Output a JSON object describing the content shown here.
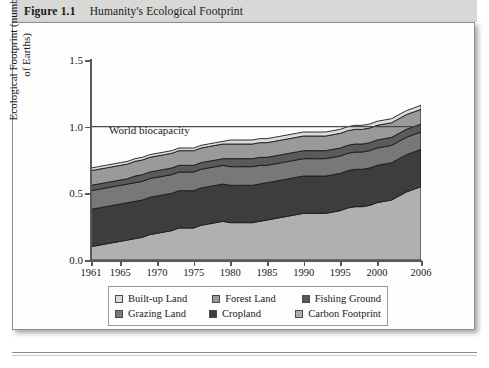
{
  "figure": {
    "number": "Figure 1.1",
    "title": "Humanity's Ecological Footprint"
  },
  "annotation": {
    "biocapacity_label": "World biocapacity"
  },
  "chart_data": {
    "type": "area",
    "title": "Humanity's Ecological Footprint",
    "xlabel": "",
    "ylabel": "Ecological Footprint (number of Earths)",
    "ylabel_line1": "Ecological Footprint (number",
    "ylabel_line2": "of Earths)",
    "xlim": [
      1961,
      2006
    ],
    "ylim": [
      0.0,
      1.5
    ],
    "yticks": [
      "0.0",
      "0.5",
      "1.0",
      "1.5"
    ],
    "ytick_values": [
      0.0,
      0.5,
      1.0,
      1.5
    ],
    "xticks": [
      "1961",
      "1965",
      "1970",
      "1975",
      "1980",
      "1985",
      "1990",
      "1995",
      "2000",
      "2006"
    ],
    "xtick_values": [
      1961,
      1965,
      1970,
      1975,
      1980,
      1985,
      1990,
      1995,
      2000,
      2006
    ],
    "grid": false,
    "stacked": true,
    "legend_position": "below-axes",
    "reference_line": {
      "label": "World biocapacity",
      "y": 1.0
    },
    "x": [
      1961,
      1962,
      1963,
      1964,
      1965,
      1966,
      1967,
      1968,
      1969,
      1970,
      1971,
      1972,
      1973,
      1974,
      1975,
      1976,
      1977,
      1978,
      1979,
      1980,
      1981,
      1982,
      1983,
      1984,
      1985,
      1986,
      1987,
      1988,
      1989,
      1990,
      1991,
      1992,
      1993,
      1994,
      1995,
      1996,
      1997,
      1998,
      1999,
      2000,
      2001,
      2002,
      2003,
      2004,
      2005,
      2006
    ],
    "series": [
      {
        "name": "Carbon Footprint",
        "color": "#b0b0b0",
        "values": [
          0.1,
          0.11,
          0.12,
          0.13,
          0.14,
          0.15,
          0.16,
          0.17,
          0.19,
          0.2,
          0.21,
          0.22,
          0.24,
          0.24,
          0.24,
          0.26,
          0.27,
          0.28,
          0.29,
          0.28,
          0.28,
          0.28,
          0.28,
          0.29,
          0.3,
          0.31,
          0.32,
          0.33,
          0.34,
          0.35,
          0.35,
          0.35,
          0.35,
          0.36,
          0.37,
          0.39,
          0.4,
          0.4,
          0.41,
          0.43,
          0.44,
          0.45,
          0.48,
          0.51,
          0.53,
          0.55
        ]
      },
      {
        "name": "Cropland",
        "color": "#3d3d3d",
        "values": [
          0.28,
          0.28,
          0.28,
          0.28,
          0.28,
          0.28,
          0.28,
          0.28,
          0.28,
          0.28,
          0.28,
          0.28,
          0.28,
          0.28,
          0.28,
          0.28,
          0.28,
          0.28,
          0.28,
          0.28,
          0.28,
          0.28,
          0.28,
          0.28,
          0.28,
          0.28,
          0.28,
          0.28,
          0.28,
          0.28,
          0.28,
          0.28,
          0.28,
          0.28,
          0.28,
          0.28,
          0.28,
          0.28,
          0.28,
          0.28,
          0.28,
          0.28,
          0.28,
          0.28,
          0.28,
          0.28
        ]
      },
      {
        "name": "Grazing Land",
        "color": "#787878",
        "values": [
          0.14,
          0.14,
          0.14,
          0.14,
          0.14,
          0.14,
          0.14,
          0.14,
          0.14,
          0.14,
          0.14,
          0.14,
          0.14,
          0.14,
          0.14,
          0.14,
          0.14,
          0.14,
          0.14,
          0.14,
          0.14,
          0.14,
          0.14,
          0.14,
          0.13,
          0.13,
          0.13,
          0.13,
          0.13,
          0.13,
          0.13,
          0.13,
          0.13,
          0.13,
          0.13,
          0.13,
          0.13,
          0.13,
          0.13,
          0.13,
          0.13,
          0.13,
          0.13,
          0.13,
          0.13,
          0.13
        ]
      },
      {
        "name": "Fishing Ground",
        "color": "#5a5a5a",
        "values": [
          0.04,
          0.04,
          0.04,
          0.04,
          0.04,
          0.04,
          0.05,
          0.05,
          0.05,
          0.05,
          0.05,
          0.05,
          0.05,
          0.05,
          0.05,
          0.05,
          0.05,
          0.05,
          0.05,
          0.06,
          0.06,
          0.06,
          0.06,
          0.06,
          0.06,
          0.06,
          0.06,
          0.06,
          0.06,
          0.06,
          0.06,
          0.06,
          0.06,
          0.06,
          0.06,
          0.06,
          0.06,
          0.06,
          0.06,
          0.06,
          0.06,
          0.06,
          0.06,
          0.06,
          0.06,
          0.06
        ]
      },
      {
        "name": "Forest Land",
        "color": "#9a9a9a",
        "values": [
          0.11,
          0.11,
          0.11,
          0.11,
          0.11,
          0.11,
          0.11,
          0.11,
          0.11,
          0.11,
          0.11,
          0.11,
          0.11,
          0.11,
          0.11,
          0.11,
          0.11,
          0.11,
          0.11,
          0.11,
          0.11,
          0.11,
          0.11,
          0.11,
          0.11,
          0.11,
          0.11,
          0.11,
          0.11,
          0.11,
          0.11,
          0.11,
          0.11,
          0.11,
          0.11,
          0.11,
          0.11,
          0.11,
          0.11,
          0.11,
          0.11,
          0.11,
          0.11,
          0.11,
          0.11,
          0.11
        ]
      },
      {
        "name": "Built-up Land",
        "color": "#dcdcdc",
        "values": [
          0.02,
          0.02,
          0.02,
          0.02,
          0.02,
          0.02,
          0.02,
          0.02,
          0.02,
          0.02,
          0.02,
          0.02,
          0.02,
          0.02,
          0.02,
          0.02,
          0.02,
          0.02,
          0.02,
          0.03,
          0.03,
          0.03,
          0.03,
          0.03,
          0.03,
          0.03,
          0.03,
          0.03,
          0.03,
          0.03,
          0.03,
          0.03,
          0.03,
          0.03,
          0.03,
          0.03,
          0.03,
          0.03,
          0.03,
          0.03,
          0.03,
          0.03,
          0.03,
          0.03,
          0.03,
          0.03
        ]
      }
    ],
    "totals": [
      0.69,
      0.7,
      0.71,
      0.72,
      0.73,
      0.74,
      0.76,
      0.77,
      0.79,
      0.8,
      0.81,
      0.82,
      0.84,
      0.84,
      0.84,
      0.86,
      0.87,
      0.88,
      0.89,
      0.9,
      0.9,
      0.9,
      0.9,
      0.91,
      0.91,
      0.92,
      0.93,
      0.94,
      0.95,
      0.96,
      0.96,
      0.96,
      0.96,
      0.97,
      0.98,
      1.0,
      1.01,
      1.01,
      1.02,
      1.04,
      1.05,
      1.06,
      1.09,
      1.12,
      1.14,
      1.16
    ]
  },
  "legend": {
    "row1": [
      {
        "label": "Built-up Land",
        "color": "#dcdcdc"
      },
      {
        "label": "Forest Land",
        "color": "#9a9a9a"
      },
      {
        "label": "Fishing Ground",
        "color": "#5a5a5a"
      }
    ],
    "row2": [
      {
        "label": "Grazing Land",
        "color": "#787878"
      },
      {
        "label": "Cropland",
        "color": "#3d3d3d"
      },
      {
        "label": "Carbon Footprint",
        "color": "#b0b0b0"
      }
    ]
  }
}
